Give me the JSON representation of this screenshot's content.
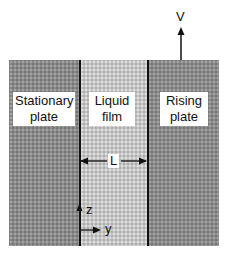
{
  "diagram": {
    "regions": [
      {
        "id": "stationary",
        "label_line1": "Stationary",
        "label_line2": "plate"
      },
      {
        "id": "liquid",
        "label_line1": "Liquid",
        "label_line2": "film"
      },
      {
        "id": "rising",
        "label_line1": "Rising",
        "label_line2": "plate"
      }
    ],
    "velocity_label": "V",
    "gap_label": "L",
    "axis_z": "z",
    "axis_y": "y"
  }
}
